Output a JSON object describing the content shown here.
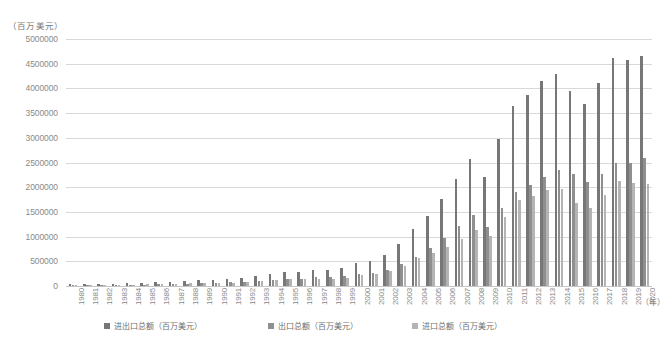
{
  "chart_data": {
    "type": "bar",
    "title": "",
    "subtitle": "",
    "unit_caption": "（百万美元）",
    "xlabel": "（年）",
    "ylabel": "",
    "ylim": [
      0,
      5000000
    ],
    "ytick_step": 500000,
    "grid": true,
    "legend_position": "bottom",
    "ytick_labels": [
      "5000000",
      "4500000",
      "4000000",
      "3500000",
      "3000000",
      "2500000",
      "2000000",
      "1500000",
      "1000000",
      "500000",
      "0"
    ],
    "ytick_values": [
      5000000,
      4500000,
      4000000,
      3500000,
      3000000,
      2500000,
      2000000,
      1500000,
      1000000,
      500000,
      0
    ],
    "categories": [
      "1980",
      "1981",
      "1982",
      "1983",
      "1984",
      "1985",
      "1986",
      "1987",
      "1988",
      "1989",
      "1990",
      "1991",
      "1992",
      "1993",
      "1994",
      "1995",
      "1996",
      "1997",
      "1998",
      "1999",
      "2000",
      "2001",
      "2002",
      "2003",
      "2004",
      "2005",
      "2006",
      "2007",
      "2008",
      "2009",
      "2010",
      "2011",
      "2012",
      "2013",
      "2014",
      "2015",
      "2016",
      "2017",
      "2018",
      "2019",
      "2020"
    ],
    "series": [
      {
        "name": "进出口总额（百万美元）",
        "color": "#777777",
        "values": [
          38140,
          44030,
          41600,
          43620,
          53550,
          69600,
          73850,
          82650,
          102790,
          111680,
          115440,
          135630,
          165530,
          195700,
          236210,
          280860,
          289880,
          325160,
          323950,
          360630,
          474300,
          509650,
          620770,
          850990,
          1154550,
          1421910,
          1760400,
          2173730,
          2563260,
          2207540,
          2974000,
          3641860,
          3867120,
          4158930,
          4301527,
          3953033,
          3685557,
          4107146,
          4622400,
          4576099,
          4655062
        ]
      },
      {
        "name": "出口总额（百万美元）",
        "color": "#8f8f8f",
        "values": [
          18120,
          22010,
          22320,
          22230,
          26140,
          27350,
          30940,
          39440,
          47520,
          52540,
          62090,
          71840,
          84940,
          91740,
          121010,
          148780,
          151050,
          182790,
          183710,
          194930,
          249200,
          266100,
          325600,
          438230,
          593330,
          761950,
          968940,
          1220060,
          1430690,
          1201610,
          1577754,
          1898381,
          2048714,
          2209005,
          2342293,
          2273468,
          2097637,
          2263346,
          2486695,
          2499484,
          2590646
        ]
      },
      {
        "name": "进口总额（百万美元）",
        "color": "#b4b4b4",
        "values": [
          20020,
          22020,
          19280,
          21390,
          27410,
          42250,
          42910,
          43210,
          55270,
          59140,
          53350,
          63790,
          80590,
          103960,
          115200,
          132080,
          138830,
          142370,
          140240,
          165700,
          225100,
          243550,
          295170,
          412760,
          561220,
          659960,
          791460,
          953670,
          1132570,
          1005930,
          1396247,
          1743483,
          1818405,
          1949925,
          1959234,
          1679565,
          1587921,
          1843793,
          2135748,
          2076615,
          2064416
        ]
      }
    ]
  },
  "legend": {
    "items": [
      {
        "label": "进出口总额（百万美元）",
        "color": "#777777"
      },
      {
        "label": "出口总额（百万美元）",
        "color": "#8f8f8f"
      },
      {
        "label": "进口总额（百万美元）",
        "color": "#b4b4b4"
      }
    ]
  }
}
